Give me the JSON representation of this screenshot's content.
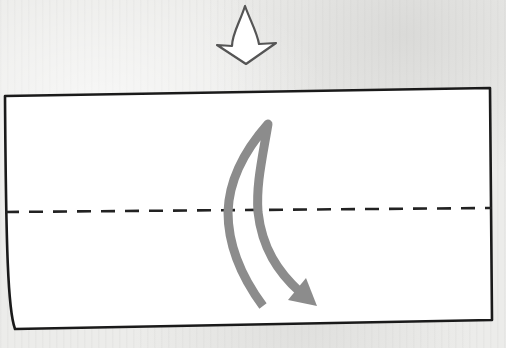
{
  "diagram": {
    "type": "origami-fold-instruction",
    "step_arrow": {
      "icon": "hollow-down-arrow-icon",
      "stroke_color": "#555555",
      "fill_color": "#ffffff"
    },
    "paper": {
      "shape": "rectangle",
      "fill_color": "#ffffff",
      "outline_color": "#1a1a1a",
      "corners": [
        [
          5,
          95
        ],
        [
          490,
          88
        ],
        [
          492,
          320
        ],
        [
          15,
          328
        ]
      ]
    },
    "fold_line": {
      "style": "dashed",
      "kind": "valley-fold",
      "color": "#222222",
      "from": [
        5,
        212
      ],
      "to": [
        492,
        208
      ]
    },
    "fold_arrow": {
      "icon": "curved-fold-arrow-icon",
      "direction": "top-half-folds-down-over-bottom",
      "color": "#8a8a8a"
    }
  }
}
